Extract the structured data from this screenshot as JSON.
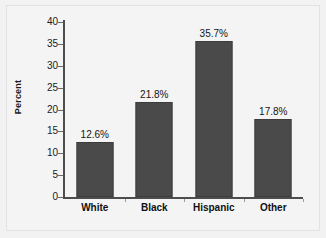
{
  "chart_data": {
    "type": "bar",
    "title": "",
    "subtitle": "",
    "xlabel": "",
    "ylabel": "Percent",
    "categories": [
      "White",
      "Black",
      "Hispanic",
      "Other"
    ],
    "values": [
      12.6,
      21.8,
      35.7,
      17.8
    ],
    "value_labels": [
      "12.6%",
      "21.8%",
      "35.7%",
      "17.8%"
    ],
    "ylim": [
      0,
      40
    ],
    "ytick_labels": [
      "40",
      "35",
      "30",
      "25",
      "20",
      "15",
      "10",
      "5",
      "0"
    ],
    "ytick_values": [
      40,
      35,
      30,
      25,
      20,
      15,
      10,
      5,
      0
    ],
    "grid": false,
    "legend": null,
    "series": [
      {
        "name": "Percent",
        "values": [
          12.6,
          21.8,
          35.7,
          17.8
        ]
      }
    ],
    "colors": {
      "bar_fill": "#4a4a4a",
      "bar_border": "#3c3c3c",
      "axis": "#4d4d4d",
      "background": "#f2f2f2",
      "plot_background": "#f4f4f4",
      "text": "#111111"
    }
  }
}
